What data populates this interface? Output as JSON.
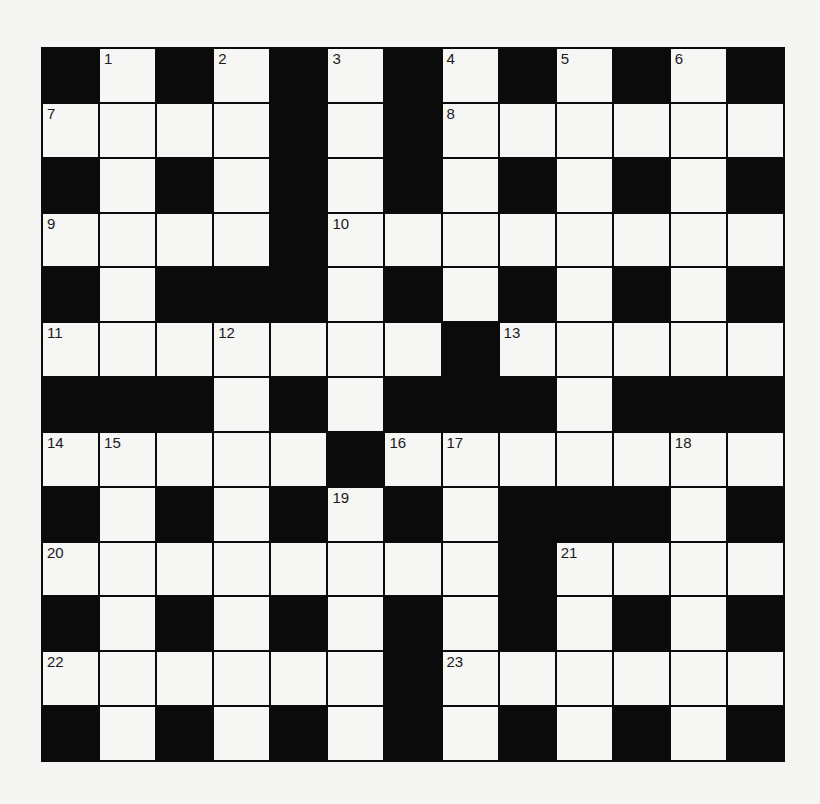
{
  "puzzle": {
    "rows": 13,
    "cols": 13,
    "grid": [
      "#.#.#.#.#.#.#",
      "....#.#......",
      "#.#.#.#.#.#.#",
      "....#........",
      "#.###.#.#.#.#",
      ".......#.....",
      "###.#.###.###",
      ".....#.......",
      "#.#.#.#.###.#",
      "........#....",
      "#.#.#.#.#.#.#",
      "......#......",
      "#.#.#.#.#.#.#"
    ],
    "numbers": [
      {
        "n": "1",
        "r": 0,
        "c": 1
      },
      {
        "n": "2",
        "r": 0,
        "c": 3
      },
      {
        "n": "3",
        "r": 0,
        "c": 5
      },
      {
        "n": "4",
        "r": 0,
        "c": 7
      },
      {
        "n": "5",
        "r": 0,
        "c": 9
      },
      {
        "n": "6",
        "r": 0,
        "c": 11
      },
      {
        "n": "7",
        "r": 1,
        "c": 0
      },
      {
        "n": "8",
        "r": 1,
        "c": 7
      },
      {
        "n": "9",
        "r": 3,
        "c": 0
      },
      {
        "n": "10",
        "r": 3,
        "c": 5
      },
      {
        "n": "11",
        "r": 5,
        "c": 0
      },
      {
        "n": "12",
        "r": 5,
        "c": 3
      },
      {
        "n": "13",
        "r": 5,
        "c": 8
      },
      {
        "n": "14",
        "r": 7,
        "c": 0
      },
      {
        "n": "15",
        "r": 7,
        "c": 1
      },
      {
        "n": "16",
        "r": 7,
        "c": 6
      },
      {
        "n": "17",
        "r": 7,
        "c": 7
      },
      {
        "n": "18",
        "r": 7,
        "c": 11
      },
      {
        "n": "19",
        "r": 8,
        "c": 5
      },
      {
        "n": "20",
        "r": 9,
        "c": 0
      },
      {
        "n": "21",
        "r": 9,
        "c": 9
      },
      {
        "n": "22",
        "r": 11,
        "c": 0
      },
      {
        "n": "23",
        "r": 11,
        "c": 7
      }
    ],
    "colors": {
      "block": "#0b0b0b",
      "empty": "#f6f6f5",
      "number": "#1a1a1a",
      "background": "#f5f5f4"
    }
  }
}
